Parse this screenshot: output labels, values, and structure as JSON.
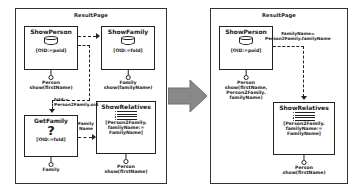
{
  "diagram": {
    "type": "uml-transformation",
    "left_panel": {
      "title": "ResultPage",
      "nodes": [
        {
          "id": "showPerson",
          "name": "ShowPerson",
          "icon": "database-cylinder-icon",
          "condition": "[OID:=poid]",
          "port": {
            "type": "provided-interface",
            "label": "Person\nshow(firstName)"
          }
        },
        {
          "id": "showFamily",
          "name": "ShowFamily",
          "icon": "database-cylinder-icon",
          "condition": "[OID:=fold]",
          "port": {
            "type": "provided-interface",
            "label": "Family\nshow(familyName)"
          }
        },
        {
          "id": "getFamily",
          "name": "GetFamily",
          "icon": "question-mark-icon",
          "condition": "[OID:=fold]",
          "port": {
            "type": "provided-interface",
            "label": "Family"
          }
        },
        {
          "id": "showRelatives",
          "name": "ShowRelatives",
          "icon": "list-icon",
          "condition": "[Person2Family.\nfamilyName:=\nFamilyName]",
          "port": {
            "type": "provided-interface",
            "label": "Person\nshow(firstName)"
          }
        }
      ],
      "edges": [
        {
          "from": "showPerson",
          "to": "showFamily",
          "style": "dashed",
          "label": ""
        },
        {
          "from": "showPerson",
          "to": "getFamily",
          "style": "dashed",
          "label": "fold:=\nPerson2Family.oid"
        },
        {
          "from": "getFamily",
          "to": "showRelatives",
          "style": "dashed",
          "label": "Family\nName"
        }
      ]
    },
    "right_panel": {
      "title": "ResultPage",
      "nodes": [
        {
          "id": "showPerson2",
          "name": "ShowPerson",
          "icon": "database-cylinder-icon",
          "condition": "[OID:=poid]",
          "port": {
            "type": "provided-interface",
            "label": "Person\nshow(firstName,\nPerson2Family.\nfamilyName)"
          }
        },
        {
          "id": "showRelatives2",
          "name": "ShowRelatives",
          "icon": "list-icon",
          "condition": "[Person2Family.\nfamilyName:=\nFamilyName]",
          "port": {
            "type": "provided-interface",
            "label": "Person\nshow(firstName)"
          }
        }
      ],
      "edges": [
        {
          "from": "showPerson2",
          "to": "showRelatives2",
          "style": "dashed",
          "label": "FamilyName=\nPerson2Family.familyName"
        }
      ]
    },
    "transform_arrow": {
      "name": "transformation-arrow",
      "direction": "right",
      "color": "#808080"
    }
  }
}
